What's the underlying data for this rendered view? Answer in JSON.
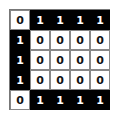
{
  "grid": {
    "rows": 5,
    "cols": 5,
    "cells": [
      [
        0,
        1,
        1,
        1,
        1
      ],
      [
        1,
        0,
        0,
        0,
        0
      ],
      [
        1,
        0,
        0,
        0,
        0
      ],
      [
        1,
        0,
        0,
        0,
        0
      ],
      [
        0,
        1,
        1,
        1,
        1
      ]
    ],
    "colors": {
      "one_bg": "#000000",
      "one_fg": "#ffffff",
      "zero_bg": "#ffffff",
      "zero_fg": "#111111"
    }
  }
}
